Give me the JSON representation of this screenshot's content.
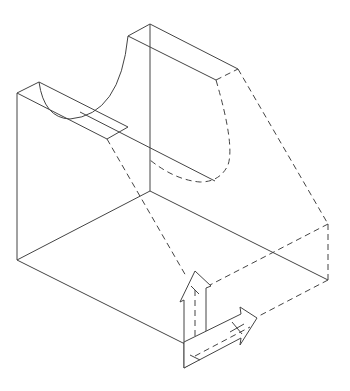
{
  "figure": {
    "type": "isometric-technical-drawing",
    "line_color": "#444444",
    "background": "#ffffff",
    "annotations": {
      "vertical_arrow": "up-arrow",
      "horizontal_arrow": "right-arrow"
    }
  }
}
